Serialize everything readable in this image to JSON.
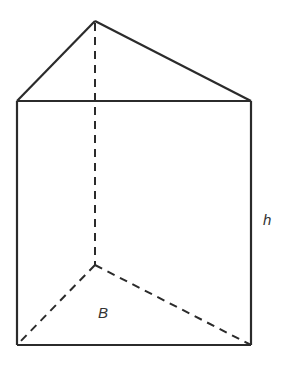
{
  "diagram": {
    "type": "triangular-prism",
    "labels": {
      "height": "h",
      "base": "B"
    },
    "colors": {
      "stroke": "#2b2b2b",
      "background": "#ffffff"
    },
    "vertices": {
      "top_apex": [
        95,
        21
      ],
      "top_left": [
        17,
        101
      ],
      "top_right": [
        251,
        101
      ],
      "bottom_back": [
        95,
        265
      ],
      "bottom_left": [
        17,
        345
      ],
      "bottom_right": [
        251,
        345
      ]
    }
  }
}
